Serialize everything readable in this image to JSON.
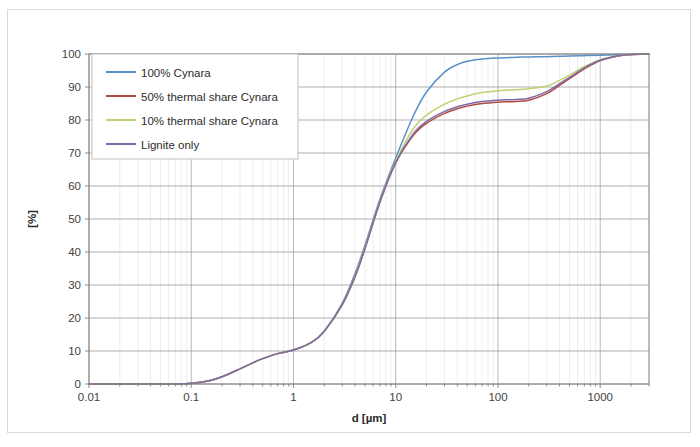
{
  "figure": {
    "border_color": "#d9d9d9"
  },
  "chart_data": {
    "type": "line",
    "title": "",
    "subtitle": "",
    "xlabel": "d [µm]",
    "ylabel": "[%]",
    "xscale": "log",
    "xlim": [
      0.01,
      3000
    ],
    "ylim": [
      0,
      100
    ],
    "grid": true,
    "legend_position": "top-left-inside",
    "xticks": [
      0.01,
      0.1,
      1,
      10,
      100,
      1000
    ],
    "xtick_labels": [
      "0.01",
      "0.1",
      "1",
      "10",
      "100",
      "1000"
    ],
    "yticks": [
      0,
      10,
      20,
      30,
      40,
      50,
      60,
      70,
      80,
      90,
      100
    ],
    "ytick_labels": [
      "0",
      "10",
      "20",
      "30",
      "40",
      "50",
      "60",
      "70",
      "80",
      "90",
      "100"
    ],
    "x": [
      0.01,
      0.02,
      0.04,
      0.07,
      0.1,
      0.15,
      0.2,
      0.3,
      0.4,
      0.5,
      0.7,
      1.0,
      1.5,
      2.0,
      3.0,
      4.0,
      5.0,
      7.0,
      10.0,
      15.0,
      20.0,
      30.0,
      40.0,
      50.0,
      70.0,
      100.0,
      150.0,
      200.0,
      300.0,
      400.0,
      500.0,
      700.0,
      1000.0,
      1500.0,
      2000.0,
      3000.0
    ],
    "series": [
      {
        "name": "100% Cynara",
        "color": "#5B8FC9",
        "values": [
          0,
          0,
          0,
          0,
          0.2,
          1.0,
          2.2,
          4.6,
          6.4,
          7.7,
          9.2,
          10.3,
          12.6,
          16.0,
          24.5,
          33.5,
          42.0,
          56.0,
          68.5,
          81.5,
          88.5,
          94.5,
          96.8,
          97.8,
          98.5,
          98.8,
          99.0,
          99.1,
          99.2,
          99.3,
          99.4,
          99.5,
          99.6,
          99.8,
          99.9,
          100.0
        ]
      },
      {
        "name": "50% thermal share Cynara",
        "color": "#B04A42",
        "values": [
          0,
          0,
          0,
          0,
          0.2,
          1.0,
          2.2,
          4.6,
          6.4,
          7.7,
          9.2,
          10.3,
          12.6,
          16.0,
          24.0,
          32.5,
          41.0,
          55.0,
          67.0,
          75.5,
          79.0,
          82.0,
          83.4,
          84.2,
          85.0,
          85.4,
          85.6,
          86.0,
          88.0,
          90.5,
          92.5,
          95.5,
          98.0,
          99.4,
          99.8,
          100.0
        ]
      },
      {
        "name": "10% thermal share Cynara",
        "color": "#C3D173",
        "values": [
          0,
          0,
          0,
          0,
          0.2,
          1.0,
          2.2,
          4.6,
          6.4,
          7.7,
          9.2,
          10.3,
          12.6,
          16.0,
          24.2,
          32.8,
          41.3,
          55.4,
          67.5,
          77.5,
          81.5,
          84.8,
          86.4,
          87.3,
          88.3,
          88.9,
          89.2,
          89.5,
          90.3,
          92.0,
          93.6,
          96.2,
          98.3,
          99.5,
          99.85,
          100.0
        ]
      },
      {
        "name": "Lignite only",
        "color": "#7E6AA5",
        "values": [
          0,
          0,
          0,
          0,
          0.2,
          1.0,
          2.2,
          4.6,
          6.4,
          7.7,
          9.2,
          10.3,
          12.6,
          16.0,
          24.1,
          32.6,
          41.1,
          55.2,
          67.2,
          76.0,
          79.6,
          82.6,
          84.0,
          84.8,
          85.6,
          86.0,
          86.2,
          86.6,
          88.6,
          91.0,
          92.9,
          95.8,
          98.1,
          99.45,
          99.82,
          100.0
        ]
      }
    ]
  },
  "legend": {
    "entries": [
      {
        "label": "100% Cynara",
        "color": "#5B8FC9"
      },
      {
        "label": "50% thermal share Cynara",
        "color": "#B04A42"
      },
      {
        "label": "10% thermal share Cynara",
        "color": "#C3D173"
      },
      {
        "label": "Lignite only",
        "color": "#7E6AA5"
      }
    ]
  }
}
